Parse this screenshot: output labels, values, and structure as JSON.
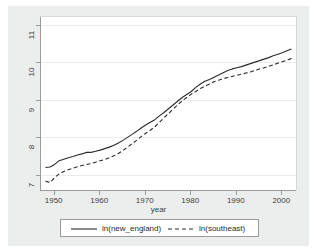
{
  "chart_data": {
    "type": "line",
    "title": "",
    "xlabel": "year",
    "ylabel": "",
    "xlim": [
      1947,
      2003
    ],
    "ylim": [
      6.6,
      11.2
    ],
    "grid": true,
    "legend_position": "bottom",
    "xticks": [
      1950,
      1960,
      1970,
      1980,
      1990,
      2000
    ],
    "xtick_labels": [
      "1950",
      "1960",
      "1970",
      "1980",
      "1990",
      "2000"
    ],
    "yticks": [
      7,
      8,
      9,
      10,
      11
    ],
    "ytick_labels": [
      "7",
      "8",
      "9",
      "10",
      "11"
    ],
    "x": [
      1948,
      1949,
      1950,
      1951,
      1952,
      1953,
      1954,
      1955,
      1956,
      1957,
      1958,
      1959,
      1960,
      1961,
      1962,
      1963,
      1964,
      1965,
      1966,
      1967,
      1968,
      1969,
      1970,
      1971,
      1972,
      1973,
      1974,
      1975,
      1976,
      1977,
      1978,
      1979,
      1980,
      1981,
      1982,
      1983,
      1984,
      1985,
      1986,
      1987,
      1988,
      1989,
      1990,
      1991,
      1992,
      1993,
      1994,
      1995,
      1996,
      1997,
      1998,
      1999,
      2000,
      2001,
      2002
    ],
    "series": [
      {
        "name": "ln(new_england)",
        "style": "solid",
        "color": "#2b2b2b",
        "values": [
          7.2,
          7.21,
          7.28,
          7.38,
          7.42,
          7.46,
          7.49,
          7.53,
          7.56,
          7.6,
          7.6,
          7.63,
          7.66,
          7.7,
          7.74,
          7.79,
          7.85,
          7.92,
          8.0,
          8.08,
          8.16,
          8.25,
          8.33,
          8.4,
          8.47,
          8.57,
          8.66,
          8.76,
          8.86,
          8.96,
          9.06,
          9.14,
          9.22,
          9.33,
          9.42,
          9.49,
          9.54,
          9.6,
          9.66,
          9.72,
          9.78,
          9.82,
          9.85,
          9.88,
          9.92,
          9.96,
          10.0,
          10.04,
          10.08,
          10.12,
          10.17,
          10.21,
          10.25,
          10.3,
          10.35
        ]
      },
      {
        "name": "ln(southeast)",
        "style": "dashed",
        "color": "#2b2b2b",
        "values": [
          6.83,
          6.8,
          6.93,
          7.03,
          7.09,
          7.14,
          7.18,
          7.22,
          7.25,
          7.28,
          7.3,
          7.34,
          7.38,
          7.41,
          7.46,
          7.51,
          7.57,
          7.65,
          7.74,
          7.83,
          7.92,
          8.02,
          8.11,
          8.19,
          8.28,
          8.4,
          8.52,
          8.63,
          8.75,
          8.86,
          8.97,
          9.06,
          9.15,
          9.22,
          9.3,
          9.36,
          9.42,
          9.48,
          9.52,
          9.56,
          9.59,
          9.62,
          9.65,
          9.68,
          9.71,
          9.74,
          9.78,
          9.82,
          9.85,
          9.89,
          9.93,
          9.97,
          10.01,
          10.05,
          10.1
        ]
      }
    ],
    "legend": [
      {
        "label": "ln(new_england)",
        "style": "solid"
      },
      {
        "label": "ln(southeast)",
        "style": "dashed"
      }
    ]
  }
}
